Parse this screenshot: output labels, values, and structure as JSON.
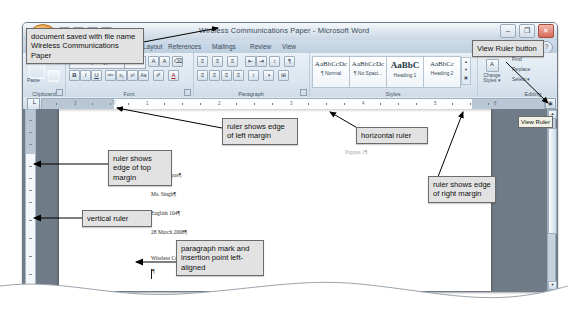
{
  "window": {
    "title": "Wireless Communications Paper - Microsoft Word",
    "minimize_label": "–",
    "maximize_label": "❐",
    "close_label": "✕",
    "help_label": "?",
    "office_button_name": "Office Button"
  },
  "tabs": [
    {
      "label": "Home",
      "active": true
    },
    {
      "label": "Insert",
      "active": false
    },
    {
      "label": "Page Layout",
      "active": false
    },
    {
      "label": "References",
      "active": false
    },
    {
      "label": "Mailings",
      "active": false
    },
    {
      "label": "Review",
      "active": false
    },
    {
      "label": "View",
      "active": false
    }
  ],
  "ribbon": {
    "groups": [
      {
        "label": "Clipboard"
      },
      {
        "label": "Font"
      },
      {
        "label": "Paragraph"
      },
      {
        "label": "Styles"
      },
      {
        "label": "Editing"
      }
    ],
    "clipboard": {
      "paste_label": "Paste",
      "format_painter_label": "✐"
    },
    "font": {
      "font_name": "Calibri (Body)",
      "font_size": "11",
      "grow_font": "A",
      "shrink_font": "A",
      "clear_formatting": "⌫",
      "bold": "B",
      "italic": "I",
      "underline": "U",
      "strikethrough": "abc",
      "subscript": "x₂",
      "superscript": "x²",
      "change_case": "Aa",
      "highlight": "✐",
      "font_color": "A"
    },
    "paragraph": {
      "bullets": "≡",
      "numbering": "≡",
      "multilevel": "≡",
      "decrease_indent": "⇤",
      "increase_indent": "⇥",
      "sort": "↕",
      "show_marks": "¶",
      "align_left": "≡",
      "align_center": "≡",
      "align_right": "≡",
      "justify": "≡",
      "line_spacing": "↕",
      "shading": "◑",
      "borders": "⊞"
    },
    "styles": [
      {
        "preview": "AaBbCcDc",
        "name": "¶ Normal"
      },
      {
        "preview": "AaBbCcDc",
        "name": "¶ No Spaci..."
      },
      {
        "preview": "AaBbC",
        "name": "Heading 1"
      },
      {
        "preview": "AaBbCc",
        "name": "Heading 2"
      }
    ],
    "change_styles_label": "Change Styles ▾",
    "editing": {
      "find_label": "Find",
      "replace_label": "Replace",
      "select_label": "Select ▾"
    }
  },
  "ruler": {
    "tab_selector_glyph": "└",
    "view_ruler_glyph": "▣",
    "horizontal_numbers": [
      "3",
      "1",
      "2",
      "3",
      "4",
      "5",
      "6"
    ],
    "left_indent_marker": "▽"
  },
  "document": {
    "header_text": "Pappas 1¶",
    "lines": [
      "Alex Pappas¶",
      "Ms. Singh¶",
      "English 104¶",
      "28 March 2008¶",
      "Wireless Communications¶"
    ]
  },
  "scrollbar": {
    "up_arrow": "▲",
    "down_arrow": "▼"
  },
  "tooltip": {
    "view_ruler": "View Ruler"
  },
  "callouts": [
    {
      "id": "c1",
      "text": "document saved with file name Wireless Communications Paper"
    },
    {
      "id": "c2",
      "text": "View Ruler button"
    },
    {
      "id": "c3",
      "text": "ruler shows edge of left margin"
    },
    {
      "id": "c4",
      "text": "horizontal ruler"
    },
    {
      "id": "c5",
      "text": "ruler shows edge of top margin"
    },
    {
      "id": "c6",
      "text": "ruler shows edge of right margin"
    },
    {
      "id": "c7",
      "text": "vertical ruler"
    },
    {
      "id": "c8",
      "text": "paragraph mark and insertion point left-aligned"
    }
  ]
}
